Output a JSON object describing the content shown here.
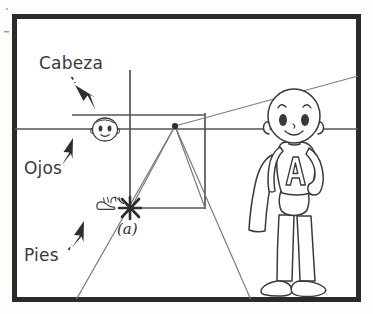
{
  "image": {
    "kind": "scanned-diagram",
    "subject": "one-point perspective construction diagram",
    "language": "Spanish",
    "width": 373,
    "height": 314,
    "background_color": "#fdfdfc",
    "ink_color": "#3a3a3a",
    "frame_color": "#2b2b2b",
    "construction_line_color": "#6b6b6b"
  },
  "labels": {
    "cabeza": "Cabeza",
    "ojos": "Ojos",
    "pies": "Pies",
    "point_marker": "(a)"
  },
  "annotations": [
    {
      "name": "cabeza",
      "text": "Cabeza",
      "points_to": "small-head",
      "arrow_direction": "down-right"
    },
    {
      "name": "ojos",
      "text": "Ojos",
      "points_to": "horizon-line",
      "arrow_direction": "up-right"
    },
    {
      "name": "pies",
      "text": "Pies",
      "points_to": "small-shoes",
      "arrow_direction": "up-right"
    }
  ],
  "geometry": {
    "frame": {
      "x": 12,
      "y": 14,
      "width": 349,
      "height": 288,
      "stroke_width": 5
    },
    "horizon_line": {
      "y": 129,
      "x_start": 14,
      "x_end": 359,
      "label": "Ojos"
    },
    "vertical_line": {
      "x": 130,
      "y_start": 70,
      "y_end": 215
    },
    "vanishing_point": {
      "x": 175,
      "y": 126
    },
    "perspective_square": {
      "x": 130,
      "y": 114,
      "width": 75,
      "height": 94
    },
    "station_point": {
      "x": 130,
      "y": 208,
      "label": "(a)"
    },
    "receding_lines": [
      {
        "from": [
          175,
          126
        ],
        "to": [
          361,
          76
        ]
      },
      {
        "from": [
          175,
          126
        ],
        "to": [
          75,
          301
        ]
      },
      {
        "from": [
          175,
          126
        ],
        "to": [
          251,
          301
        ]
      }
    ]
  },
  "figures": {
    "small_head": {
      "name": "small-head",
      "x": 105,
      "y": 129,
      "meaning": "head height marker at horizon"
    },
    "small_shoes": {
      "name": "small-shoes",
      "x": 108,
      "y": 205,
      "meaning": "feet position marker"
    },
    "hero": {
      "name": "cartoon-superhero",
      "chest_letter": "A",
      "has_cape": true,
      "pose": "standing, left hand on hip",
      "eye_level_on_horizon": true
    }
  }
}
